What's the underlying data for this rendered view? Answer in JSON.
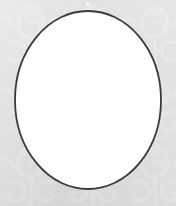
{
  "canvas": {
    "width": 176,
    "height": 206,
    "background_color": "#dcdcdc",
    "pattern_color": "#e4e4e4",
    "description": "Faint damask scrollwork wallpaper background"
  },
  "oval": {
    "label": "oval frame",
    "fill_color": "#ffffff",
    "stroke_color": "#3a3a3a",
    "stroke_width": 1.8,
    "center_x": 88,
    "center_y": 100,
    "radius_x": 73,
    "radius_y": 89,
    "bounds": {
      "left": 15,
      "top": 11,
      "right": 161,
      "bottom": 189
    }
  },
  "marks": {
    "speck": {
      "label": "light speck above oval apex",
      "x": 88,
      "y": 4,
      "color": "#f2f2f2"
    }
  },
  "chart_data": null
}
